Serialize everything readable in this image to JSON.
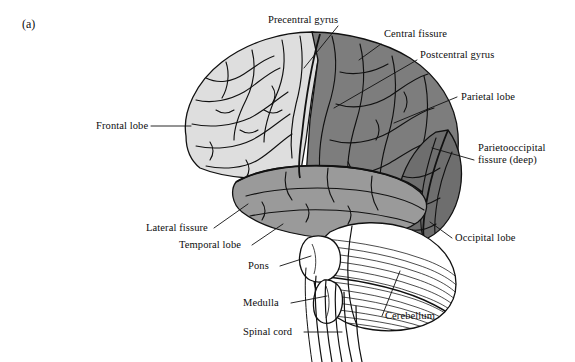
{
  "figure": {
    "panel_letter": "(a)",
    "background_color": "#ffffff",
    "ink_color": "#0d0d0d"
  },
  "regions": [
    {
      "key": "frontal",
      "name": "Frontal lobe",
      "fill": "#dedede"
    },
    {
      "key": "parietal",
      "name": "Parietal lobe",
      "fill": "#7d7d7d"
    },
    {
      "key": "occipital",
      "name": "Occipital lobe",
      "fill": "#6e6e6e"
    },
    {
      "key": "temporal",
      "name": "Temporal lobe",
      "fill": "#9a9a9a"
    },
    {
      "key": "cerebellum",
      "name": "Cerebellum",
      "fill": "#ffffff"
    },
    {
      "key": "brainstem",
      "name": "Brainstem",
      "fill": "#ffffff"
    }
  ],
  "labels": {
    "precentral_gyrus": "Precentral gyrus",
    "central_fissure": "Central fissure",
    "postcentral_gyrus": "Postcentral gyrus",
    "parietal_lobe": "Parietal lobe",
    "parietooccipital_fissure_line1": "Parietooccipital",
    "parietooccipital_fissure_line2": "fissure (deep)",
    "occipital_lobe": "Occipital lobe",
    "frontal_lobe": "Frontal lobe",
    "lateral_fissure": "Lateral fissure",
    "temporal_lobe": "Temporal lobe",
    "pons": "Pons",
    "medulla": "Medulla",
    "spinal_cord": "Spinal cord",
    "cerebellum": "Cerebellum"
  }
}
